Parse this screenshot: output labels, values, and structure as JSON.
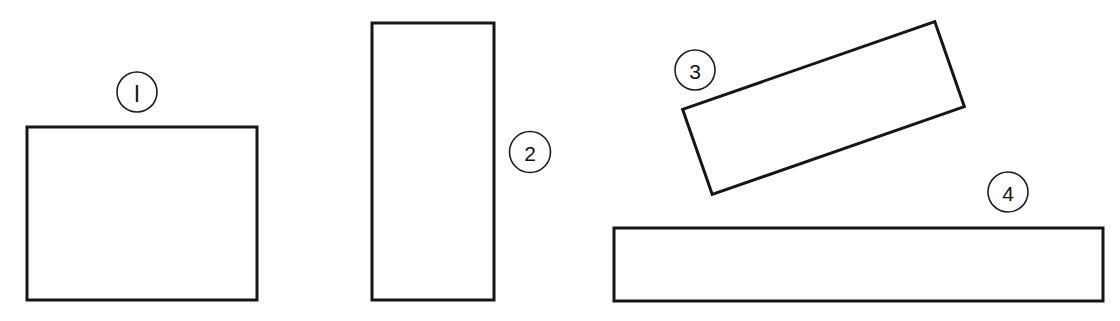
{
  "figure": {
    "background_color": "#ffffff",
    "stroke_color": "#161616",
    "canvas": {
      "width": 1120,
      "height": 321
    }
  },
  "shapes": [
    {
      "id": "shape-1",
      "label": "l",
      "label_reading": "1",
      "kind": "rectangle",
      "x": 27,
      "y": 127,
      "width": 230,
      "height": 173,
      "rotation_deg": 0,
      "label_cx": 137,
      "label_cy": 92,
      "label_r": 20
    },
    {
      "id": "shape-2",
      "label": "2",
      "label_reading": "2",
      "kind": "rectangle",
      "x": 372,
      "y": 23,
      "width": 122,
      "height": 277,
      "rotation_deg": 0,
      "label_cx": 530,
      "label_cy": 152,
      "label_r": 20.5
    },
    {
      "id": "shape-3",
      "label": "3",
      "label_reading": "3",
      "kind": "rectangle",
      "x": 690,
      "y": 63,
      "width": 267,
      "height": 90,
      "rotation_deg": -19.2,
      "label_cx": 695,
      "label_cy": 70,
      "label_r": 20
    },
    {
      "id": "shape-4",
      "label": "4",
      "label_reading": "4",
      "kind": "rectangle",
      "x": 614,
      "y": 228,
      "width": 489,
      "height": 73,
      "rotation_deg": 0,
      "label_cx": 1008,
      "label_cy": 192,
      "label_r": 20
    }
  ]
}
